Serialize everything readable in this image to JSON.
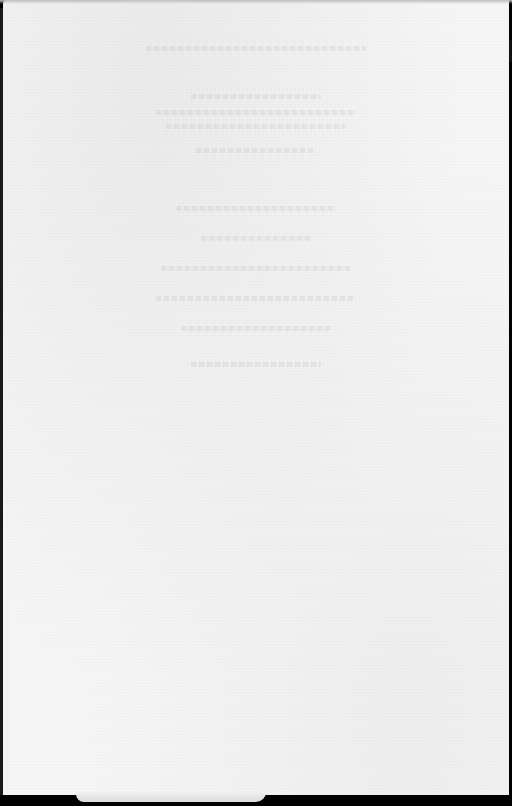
{
  "document": {
    "type": "scanned-page",
    "title": "",
    "body_text": "",
    "legibility": "illegible bleed-through only",
    "colors": {
      "paper": "#f6f6f6",
      "border": "#000000",
      "ghost_text": "#969696"
    },
    "ghost_lines": [
      {
        "top": 46,
        "width": 220
      },
      {
        "top": 94,
        "width": 130
      },
      {
        "top": 110,
        "width": 200
      },
      {
        "top": 124,
        "width": 180
      },
      {
        "top": 148,
        "width": 120
      },
      {
        "top": 206,
        "width": 160
      },
      {
        "top": 236,
        "width": 110
      },
      {
        "top": 266,
        "width": 190
      },
      {
        "top": 296,
        "width": 200
      },
      {
        "top": 326,
        "width": 150
      },
      {
        "top": 362,
        "width": 130
      }
    ]
  }
}
